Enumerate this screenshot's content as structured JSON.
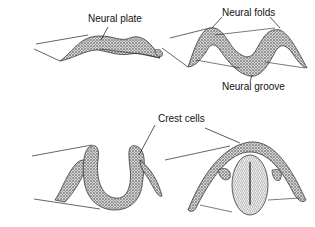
{
  "figure": {
    "panels": [
      {
        "id": "A",
        "stage": "neural plate",
        "labels": [
          "Neural plate"
        ]
      },
      {
        "id": "B",
        "stage": "neural folds",
        "labels": [
          "Neural folds",
          "Neural groove"
        ]
      },
      {
        "id": "C",
        "stage": "folds closing",
        "labels": [
          "Crest cells"
        ]
      },
      {
        "id": "D",
        "stage": "neural tube",
        "labels": []
      }
    ]
  },
  "labels": {
    "neural_plate": "Neural plate",
    "neural_folds": "Neural folds",
    "neural_groove": "Neural groove",
    "crest_cells": "Crest cells"
  },
  "colors": {
    "ink": "#1a1a1a",
    "tissue": "#8a8a8a",
    "background": "#ffffff"
  }
}
